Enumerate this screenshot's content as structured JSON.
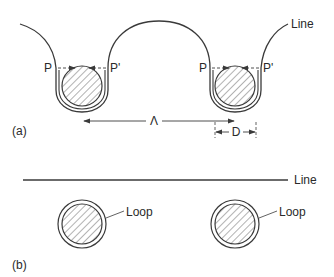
{
  "figure": {
    "panel_a": {
      "label": "(a)",
      "line_label": "Line",
      "left_loop": {
        "p_label": "P",
        "p_prime_label": "P'"
      },
      "right_loop": {
        "p_label": "P",
        "p_prime_label": "P'"
      },
      "wavelength_label": "Λ",
      "diameter_label": "D"
    },
    "panel_b": {
      "label": "(b)",
      "line_label": "Line",
      "loop_labels": [
        "Loop",
        "Loop"
      ]
    },
    "colors": {
      "ink": "#3a3a3a",
      "hatch": "#555555",
      "background": "#ffffff"
    }
  }
}
